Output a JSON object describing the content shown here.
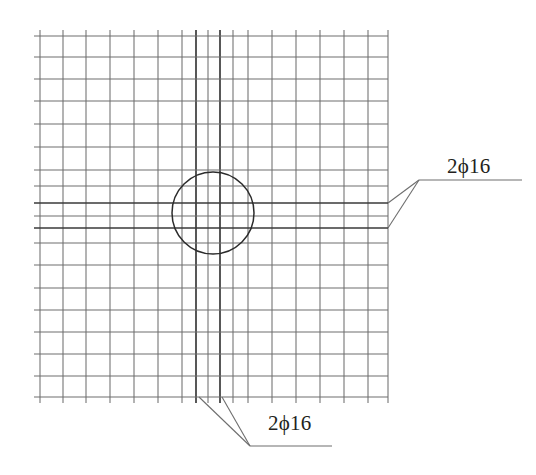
{
  "drawing": {
    "type": "reinforcement-grid-detail",
    "title_visible": false,
    "background_color": "#ffffff",
    "line_color": "#6e6e6e",
    "bold_line_color": "#3a3a3a",
    "circle_color": "#2b2b2b",
    "leader_color": "#6e6e6e",
    "text_color": "#231f20",
    "grid": {
      "x_min": 40,
      "x_max": 388,
      "y_min": 36,
      "y_max": 397,
      "vertical_lines": [
        {
          "x": 40,
          "weight": "thin"
        },
        {
          "x": 63,
          "weight": "thin"
        },
        {
          "x": 86,
          "weight": "thin"
        },
        {
          "x": 110,
          "weight": "thin"
        },
        {
          "x": 134,
          "weight": "thin"
        },
        {
          "x": 158,
          "weight": "thin"
        },
        {
          "x": 182,
          "weight": "thin"
        },
        {
          "x": 196,
          "weight": "bold"
        },
        {
          "x": 208,
          "weight": "thin"
        },
        {
          "x": 220,
          "weight": "bold"
        },
        {
          "x": 233,
          "weight": "thin"
        },
        {
          "x": 248,
          "weight": "thin"
        },
        {
          "x": 272,
          "weight": "thin"
        },
        {
          "x": 296,
          "weight": "thin"
        },
        {
          "x": 320,
          "weight": "thin"
        },
        {
          "x": 344,
          "weight": "thin"
        },
        {
          "x": 368,
          "weight": "thin"
        },
        {
          "x": 388,
          "weight": "thin"
        }
      ],
      "horizontal_lines": [
        {
          "y": 36,
          "weight": "thin"
        },
        {
          "y": 57,
          "weight": "thin"
        },
        {
          "y": 79,
          "weight": "thin"
        },
        {
          "y": 101,
          "weight": "thin"
        },
        {
          "y": 124,
          "weight": "thin"
        },
        {
          "y": 147,
          "weight": "thin"
        },
        {
          "y": 170,
          "weight": "thin"
        },
        {
          "y": 186,
          "weight": "thin"
        },
        {
          "y": 203,
          "weight": "bold"
        },
        {
          "y": 216,
          "weight": "thin"
        },
        {
          "y": 228,
          "weight": "bold"
        },
        {
          "y": 243,
          "weight": "thin"
        },
        {
          "y": 265,
          "weight": "thin"
        },
        {
          "y": 288,
          "weight": "thin"
        },
        {
          "y": 310,
          "weight": "thin"
        },
        {
          "y": 332,
          "weight": "thin"
        },
        {
          "y": 354,
          "weight": "thin"
        },
        {
          "y": 376,
          "weight": "thin"
        },
        {
          "y": 397,
          "weight": "thin"
        }
      ]
    },
    "circle": {
      "cx": 213,
      "cy": 213,
      "r": 41
    },
    "annotations": [
      {
        "id": "right",
        "label": "2ϕ16",
        "shelf": {
          "x1": 419,
          "y1": 180,
          "x2": 522,
          "y2": 180
        },
        "leaders": [
          {
            "x1": 388,
            "y1": 203,
            "x2": 419,
            "y2": 180
          },
          {
            "x1": 388,
            "y1": 228,
            "x2": 419,
            "y2": 180
          }
        ],
        "text_x": 447,
        "text_y": 154
      },
      {
        "id": "bottom",
        "label": "2ϕ16",
        "shelf": {
          "x1": 250,
          "y1": 446,
          "x2": 332,
          "y2": 446
        },
        "leaders": [
          {
            "x1": 199,
            "y1": 397,
            "x2": 250,
            "y2": 446
          },
          {
            "x1": 222,
            "y1": 397,
            "x2": 250,
            "y2": 446
          }
        ],
        "text_x": 268,
        "text_y": 411
      }
    ]
  }
}
